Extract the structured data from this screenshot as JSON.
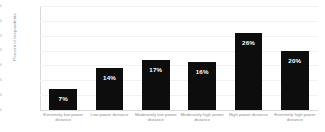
{
  "chart_data": {
    "type": "bar",
    "title": "",
    "xlabel": "",
    "ylabel": "Percent of respondents",
    "categories": [
      "Extremely low power distance",
      "Low power distance",
      "Moderately low power distance",
      "Moderately high power distance",
      "High power distance",
      "Extremely high power distance"
    ],
    "values": [
      7,
      14,
      17,
      16,
      26,
      20
    ],
    "value_labels": [
      "7%",
      "14%",
      "17%",
      "16%",
      "26%",
      "20%"
    ],
    "ylim": [
      0,
      35
    ],
    "yticks": [
      0,
      5,
      10,
      15,
      20,
      25,
      30,
      35
    ],
    "ytick_labels": [
      "0%",
      "5%",
      "10%",
      "15%",
      "20%",
      "25%",
      "30%",
      "35%"
    ],
    "grid": true,
    "legend": false,
    "bar_color": "#0d0d0d",
    "value_label_color": "#ffffff",
    "gridline_color": "#f2f2f2",
    "axis_color": "#d9d9d9",
    "tick_text_color": "#a6a6a6",
    "background": "#ffffff"
  }
}
